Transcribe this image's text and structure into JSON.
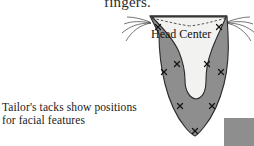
{
  "page": {
    "background_color": "#ffffff",
    "width": 254,
    "height": 146
  },
  "cropped_text": {
    "text": "fingers.",
    "note_visible": "partially cropped at top edge"
  },
  "caption": {
    "line1": "Tailor's tacks show positions",
    "line2": "for facial features"
  },
  "diagram": {
    "label_head_center": "Head Center",
    "colors": {
      "fabric_gray": "#8e8e8e",
      "fabric_gray_dark_edge": "#6f6f6f",
      "inner_light": "#f2f2f0",
      "outline": "#2b2b2b",
      "thread_line": "#3a3a3a",
      "tack_mark": "#1a1a1a",
      "swatch_gray": "#8e8e8e"
    },
    "tailors_tacks": [
      {
        "id": "tack-upper-left",
        "x": 158,
        "y": 27
      },
      {
        "id": "tack-upper-right",
        "x": 219,
        "y": 27
      },
      {
        "id": "tack-mid-left-inner",
        "x": 177,
        "y": 64
      },
      {
        "id": "tack-mid-right-inner",
        "x": 207,
        "y": 64
      },
      {
        "id": "tack-mid-left-edge",
        "x": 164,
        "y": 72
      },
      {
        "id": "tack-mid-right-edge",
        "x": 221,
        "y": 72
      },
      {
        "id": "tack-lower-left",
        "x": 180,
        "y": 106
      },
      {
        "id": "tack-lower-right",
        "x": 212,
        "y": 106
      },
      {
        "id": "tack-bottom-point",
        "x": 195,
        "y": 131
      }
    ],
    "thread_tails": {
      "left_count": 4,
      "right_count": 4
    },
    "fabric_swatch": {
      "x": 224,
      "y": 118,
      "width": 30,
      "height": 28
    }
  }
}
